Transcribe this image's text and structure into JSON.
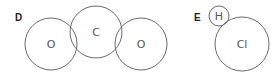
{
  "diagrams": [
    {
      "label": "D",
      "molecule": "CO2",
      "atoms": [
        {
          "symbol": "O",
          "cx": 51,
          "cy": 44,
          "r": 26
        },
        {
          "symbol": "C",
          "cx": 96,
          "cy": 32,
          "r": 26
        },
        {
          "symbol": "O",
          "cx": 141,
          "cy": 44,
          "r": 26
        }
      ]
    },
    {
      "label": "E",
      "molecule": "HCl",
      "atoms": [
        {
          "symbol": "H",
          "cx": 219,
          "cy": 16,
          "r": 10
        },
        {
          "symbol": "Cl",
          "cx": 242,
          "cy": 44,
          "r": 27
        }
      ]
    }
  ],
  "colors": {
    "stroke": "#6a6a6a",
    "label": "#222222",
    "atom_text": "#555555"
  }
}
